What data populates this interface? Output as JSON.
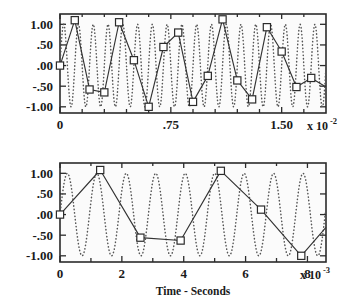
{
  "figure": {
    "background_color": "#ffffff",
    "ink_color": "#2b2b2b",
    "dotted_color": "#555555"
  },
  "chart_data": [
    {
      "id": "top-panel",
      "type": "line",
      "title": "",
      "subtitle": "",
      "xlabel": "",
      "ylabel": "",
      "xlim": [
        0,
        0.018
      ],
      "ylim": [
        -1.15,
        1.25
      ],
      "grid": false,
      "legend": false,
      "x_exponent_label": {
        "base": "x 10",
        "exponent": "-2"
      },
      "x_tick_values": [
        0,
        0.0075,
        0.015
      ],
      "x_tick_labels": [
        "0",
        ".75",
        "1.50"
      ],
      "x_minor_tick_step": 0.0015,
      "y_tick_values": [
        1.0,
        0.5,
        0.0,
        -0.5,
        -1.0
      ],
      "y_tick_labels": [
        "1.00",
        ".50",
        ".00",
        "-.50",
        "-1.00"
      ],
      "series": [
        {
          "name": "underlying-signal",
          "style": "dotted",
          "kind": "sine",
          "amplitude": 1.0,
          "frequency_hz": 1000,
          "phase": 0.0,
          "description": "dotted high-frequency sine wave, 18 cycles across the window"
        },
        {
          "name": "sampled-signal",
          "style": "solid-with-square-markers",
          "sample_interval": 0.001,
          "x": [
            0.0,
            0.001,
            0.002,
            0.003,
            0.004,
            0.005,
            0.006,
            0.007,
            0.008,
            0.009,
            0.01,
            0.011,
            0.012,
            0.013,
            0.014,
            0.015,
            0.016,
            0.017
          ],
          "values": [
            0.0,
            1.1,
            -0.58,
            -0.65,
            1.05,
            0.13,
            -1.0,
            0.45,
            0.8,
            -0.88,
            -0.25,
            1.12,
            -0.36,
            -0.82,
            0.93,
            0.34,
            -0.52,
            -0.3
          ]
        }
      ]
    },
    {
      "id": "bottom-panel",
      "type": "line",
      "title": "",
      "subtitle": "",
      "xlabel": "Time - Seconds",
      "ylabel": "",
      "xlim": [
        0,
        0.0086
      ],
      "ylim": [
        -1.15,
        1.25
      ],
      "grid": false,
      "legend": false,
      "x_exponent_label": {
        "base": "x 10",
        "exponent": "-3"
      },
      "x_tick_values": [
        0,
        0.002,
        0.004,
        0.006,
        0.008
      ],
      "x_tick_labels": [
        "0",
        "2",
        "4",
        "6",
        "8"
      ],
      "x_minor_tick_step": 0.001,
      "y_tick_values": [
        1.0,
        0.5,
        0.0,
        -0.5,
        -1.0
      ],
      "y_tick_labels": [
        "1.00",
        ".50",
        ".00",
        "-.50",
        "-1.00"
      ],
      "series": [
        {
          "name": "underlying-signal",
          "style": "dotted",
          "kind": "sine",
          "amplitude": 1.0,
          "frequency_hz": 1050,
          "phase": 0.0,
          "description": "dotted high-frequency sine wave, about 9 cycles across the window"
        },
        {
          "name": "sampled-signal",
          "style": "solid-with-square-markers",
          "sample_interval": 0.0013,
          "x": [
            0.0,
            0.0013,
            0.0026,
            0.0039,
            0.0052,
            0.0065,
            0.0078
          ],
          "values": [
            0.0,
            1.08,
            -0.56,
            -0.63,
            1.06,
            0.12,
            -1.0
          ]
        }
      ]
    }
  ]
}
